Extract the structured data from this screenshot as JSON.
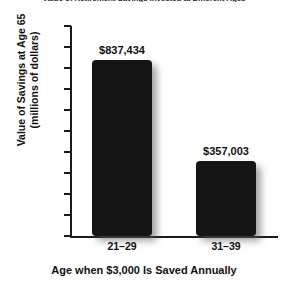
{
  "chart_data": {
    "type": "bar",
    "title": "Value of Retirement Savings Invested at Different Ages",
    "xlabel": "Age when $3,000 Is Saved Annually",
    "ylabel_line1": "Value of Savings at Age 65",
    "ylabel_line2": "(millions of dollars)",
    "categories": [
      "21–29",
      "31–39"
    ],
    "values": [
      0.837434,
      0.357003
    ],
    "data_labels": [
      "$837,434",
      "$357,003"
    ],
    "ylim": [
      0,
      1.0
    ],
    "ytick_labels": [
      "1.0",
      "0.9",
      "0.8",
      "0.7",
      "0.6",
      "0.5",
      "0.4",
      "0.3",
      "0.2",
      "0.1",
      "0"
    ],
    "ytick_values": [
      1.0,
      0.9,
      0.8,
      0.7,
      0.6,
      0.5,
      0.4,
      0.3,
      0.2,
      0.1,
      0
    ],
    "grid": false,
    "legend": "none",
    "bar_color": "#141414",
    "axis_color": "#1a1a1a",
    "background_color": "#ffffff"
  }
}
